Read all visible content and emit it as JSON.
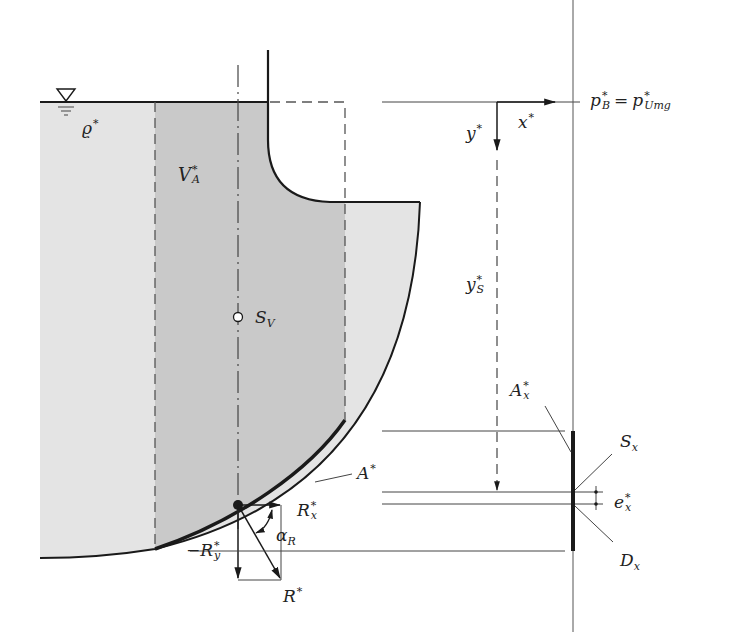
{
  "diagram": {
    "type": "hydrostatic force on curved surface",
    "labels": {
      "density": {
        "base": "ϱ",
        "sup": "*"
      },
      "volume": {
        "base": "V",
        "sup": "*",
        "sub": "A"
      },
      "centroid_volume": {
        "base": "S",
        "sub": "V"
      },
      "surface": {
        "base": "A",
        "sup": "*"
      },
      "projected_surface": {
        "base": "A",
        "sup": "*",
        "sub": "x"
      },
      "pressure_left": {
        "base": "p",
        "sup": "*",
        "sub": "B"
      },
      "equals": "=",
      "pressure_right": {
        "base": "p",
        "sup": "*",
        "sub": "Umg"
      },
      "x_axis": {
        "base": "x",
        "sup": "*"
      },
      "y_axis": {
        "base": "y",
        "sup": "*"
      },
      "centroid_depth": {
        "base": "y",
        "sup": "*",
        "sub": "S"
      },
      "centroid_projected": {
        "base": "S",
        "sub": "x"
      },
      "pressure_center": {
        "base": "D",
        "sub": "x"
      },
      "eccentricity": {
        "base": "e",
        "sup": "*",
        "sub": "x"
      },
      "force_x": {
        "base": "R",
        "sup": "*",
        "sub": "x"
      },
      "force_y_prefix": "−",
      "force_y": {
        "base": "R",
        "sup": "*",
        "sub": "y"
      },
      "angle": {
        "base": "α",
        "sub": "R"
      },
      "resultant": {
        "base": "R",
        "sup": "*"
      }
    },
    "symbols": {
      "free_surface": "water-level-triangle-icon"
    },
    "colors": {
      "fluid_light": "#e4e4e4",
      "fluid_dark": "#c9c9c9",
      "line": "#1a1a1a",
      "thin_line": "#444444"
    }
  }
}
